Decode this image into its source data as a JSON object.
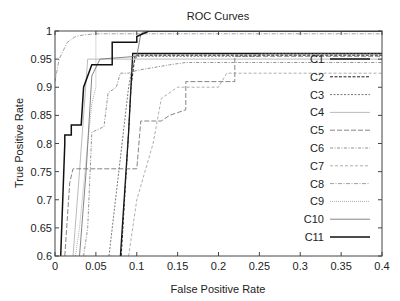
{
  "chart_data": {
    "type": "line",
    "title": "ROC Curves",
    "xlabel": "False Positive Rate",
    "ylabel": "True Positive Rate",
    "xlim": [
      0,
      0.4
    ],
    "ylim": [
      0.6,
      1
    ],
    "xticks": [
      0,
      0.05,
      0.1,
      0.15,
      0.2,
      0.25,
      0.3,
      0.35,
      0.4
    ],
    "xtick_labels": [
      "0",
      "0.05",
      "0.1",
      "0.15",
      "0.2",
      "0.25",
      "0.3",
      "0.35",
      "0.4"
    ],
    "yticks": [
      0.6,
      0.65,
      0.7,
      0.75,
      0.8,
      0.85,
      0.9,
      0.95,
      1
    ],
    "ytick_labels": [
      "0.6",
      "0.65",
      "0.7",
      "0.75",
      "0.8",
      "0.85",
      "0.9",
      "0.95",
      "1"
    ],
    "grid": false,
    "legend_position": "right inside",
    "series": [
      {
        "name": "C1",
        "color": "#111111",
        "width": 1.3,
        "dash": "",
        "x": [
          0.08,
          0.09,
          0.095,
          0.1,
          0.4
        ],
        "y": [
          0.6,
          0.82,
          0.96,
          0.96,
          0.96
        ]
      },
      {
        "name": "C2",
        "color": "#222222",
        "width": 1.0,
        "dash": "3,1.5",
        "x": [
          0.081,
          0.09,
          0.093,
          0.098,
          0.4
        ],
        "y": [
          0.6,
          0.82,
          0.9,
          0.957,
          0.957
        ]
      },
      {
        "name": "C3",
        "color": "#555555",
        "width": 0.8,
        "dash": "2,1.5",
        "x": [
          0.066,
          0.09,
          0.095,
          0.1,
          0.25,
          0.25,
          0.4
        ],
        "y": [
          0.6,
          0.9,
          0.94,
          0.955,
          0.955,
          0.96,
          0.96
        ]
      },
      {
        "name": "C4",
        "color": "#aaaaaa",
        "width": 0.8,
        "dash": "",
        "x": [
          0.022,
          0.03,
          0.035,
          0.04,
          0.1,
          0.4
        ],
        "y": [
          0.6,
          0.75,
          0.85,
          0.95,
          0.95,
          0.95
        ]
      },
      {
        "name": "C5",
        "color": "#666666",
        "width": 0.8,
        "dash": "5,2",
        "x": [
          0.012,
          0.018,
          0.022,
          0.05,
          0.1,
          0.105,
          0.13,
          0.14,
          0.16,
          0.16,
          0.22,
          0.22,
          0.4
        ],
        "y": [
          0.6,
          0.73,
          0.755,
          0.755,
          0.755,
          0.84,
          0.84,
          0.85,
          0.86,
          0.91,
          0.91,
          0.955,
          0.955
        ]
      },
      {
        "name": "C6",
        "color": "#777777",
        "width": 0.8,
        "dash": "3,1.5,1,1.5",
        "x": [
          0.035,
          0.04,
          0.045,
          0.06,
          0.065,
          0.075,
          0.08,
          0.09,
          0.1,
          0.14,
          0.16,
          0.4
        ],
        "y": [
          0.6,
          0.65,
          0.82,
          0.83,
          0.89,
          0.9,
          0.925,
          0.925,
          0.93,
          0.94,
          0.944,
          0.944
        ]
      },
      {
        "name": "C7",
        "color": "#999999",
        "width": 0.8,
        "dash": "3,2",
        "x": [
          0.09,
          0.1,
          0.12,
          0.13,
          0.15,
          0.2,
          0.21,
          0.4
        ],
        "y": [
          0.6,
          0.7,
          0.8,
          0.88,
          0.9,
          0.9,
          0.925,
          0.925
        ]
      },
      {
        "name": "C8",
        "color": "#888888",
        "width": 0.8,
        "dash": "4,1.5,1,1.5",
        "x": [
          0.0,
          0.005,
          0.015,
          0.025,
          0.035,
          0.05,
          0.4
        ],
        "y": [
          0.91,
          0.95,
          0.98,
          0.99,
          0.993,
          0.995,
          0.995
        ]
      },
      {
        "name": "C9",
        "color": "#999999",
        "width": 0.8,
        "dash": "1,1",
        "x": [
          0.025,
          0.03,
          0.04,
          0.045,
          0.05,
          0.05,
          0.4
        ],
        "y": [
          0.6,
          0.65,
          0.8,
          0.87,
          0.9,
          1.0,
          1.0
        ]
      },
      {
        "name": "C10",
        "color": "#777777",
        "width": 0.9,
        "dash": "",
        "x": [
          0.03,
          0.038,
          0.045,
          0.055,
          0.1,
          0.105,
          0.11,
          0.4
        ],
        "y": [
          0.6,
          0.75,
          0.92,
          0.95,
          0.955,
          0.995,
          1.0,
          1.0
        ]
      },
      {
        "name": "C11",
        "color": "#111111",
        "width": 1.5,
        "dash": "",
        "x": [
          0.007,
          0.012,
          0.012,
          0.02,
          0.02,
          0.032,
          0.035,
          0.045,
          0.045,
          0.07,
          0.07,
          0.1,
          0.1,
          0.115,
          0.4
        ],
        "y": [
          0.6,
          0.8,
          0.815,
          0.815,
          0.833,
          0.833,
          0.9,
          0.94,
          0.94,
          0.94,
          0.98,
          0.98,
          0.99,
          1.0,
          1.0
        ]
      }
    ]
  }
}
